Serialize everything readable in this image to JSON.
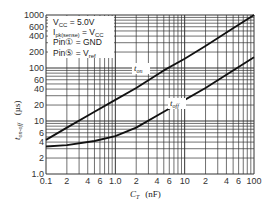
{
  "chart_data": {
    "type": "line",
    "title": "",
    "xlabel": "C_T (nF)",
    "ylabel": "t_on-off (µs)",
    "xscale": "log",
    "yscale": "log",
    "xlim": [
      0.1,
      100
    ],
    "ylim": [
      1,
      1000
    ],
    "grid": true,
    "x_ticks": [
      "0.1",
      "2",
      "4",
      "6",
      "1.0",
      "2",
      "4",
      "6",
      "10",
      "2",
      "4",
      "6",
      "100"
    ],
    "y_ticks": [
      "1000",
      "600",
      "400",
      "200",
      "100",
      "60",
      "40",
      "20",
      "10",
      "6",
      "4",
      "2",
      "1.0"
    ],
    "legend": [
      "V_CC = 5.0V",
      "I_pk(sense) = V_CC",
      "Pin(1) = GND",
      "Pin(5) = V_ref"
    ],
    "series": [
      {
        "name": "t_on",
        "x": [
          0.1,
          0.2,
          0.5,
          1,
          2,
          5,
          10,
          20,
          50,
          100
        ],
        "values": [
          4.4,
          7.5,
          15,
          25,
          42,
          90,
          150,
          260,
          560,
          1000
        ]
      },
      {
        "name": "t_off",
        "x": [
          0.1,
          0.2,
          0.5,
          1,
          2,
          5,
          10,
          20,
          50,
          100
        ],
        "values": [
          3.3,
          3.5,
          4.2,
          5.2,
          7.5,
          15,
          25,
          42,
          90,
          160
        ]
      }
    ]
  },
  "labels": {
    "t_on": "t",
    "t_on_sub": "on",
    "t_off": "t",
    "t_off_sub": "off",
    "xlabel_main": "C",
    "xlabel_sub": "T",
    "xlabel_unit": "(nF)",
    "ylabel_main": "t",
    "ylabel_sub": "on-off",
    "ylabel_unit": "(µs)",
    "legend_1": "V",
    "legend_1_sub": "CC",
    "legend_1_val": " = 5.0V",
    "legend_2": "I",
    "legend_2_sub": "pk(sense)",
    "legend_2_val": " = V",
    "legend_2_val_sub": "CC",
    "legend_3": "Pin① = GND",
    "legend_4": "Pin⑤ = V",
    "legend_4_sub": "ref"
  },
  "colors": {
    "grid": "#333333",
    "curve": "#111111",
    "text": "#222222"
  }
}
